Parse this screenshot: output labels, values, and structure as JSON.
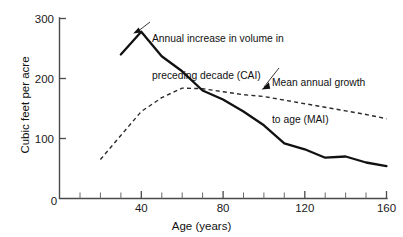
{
  "chart_data": {
    "type": "line",
    "title": "",
    "xlabel": "Age (years)",
    "ylabel": "Cubic feet per acre",
    "xlim": [
      0,
      160
    ],
    "ylim": [
      0,
      300
    ],
    "grid": false,
    "legend_position": "annotations-on-plot",
    "x_ticks": [
      0,
      40,
      80,
      120,
      160
    ],
    "x_tick_labels": [
      "0",
      "40",
      "80",
      "120",
      "160"
    ],
    "x_minor_tick_step": 10,
    "y_ticks": [
      0,
      100,
      200,
      300
    ],
    "y_tick_labels": [
      "0",
      "100",
      "200",
      "300"
    ],
    "series": [
      {
        "name": "Annual increase in volume in preceding decade (CAI)",
        "short_name": "CAI",
        "style": "solid",
        "color": "#111111",
        "x": [
          30,
          40,
          50,
          60,
          70,
          80,
          90,
          100,
          110,
          120,
          130,
          140,
          150,
          160
        ],
        "values": [
          240,
          278,
          237,
          212,
          180,
          165,
          145,
          122,
          92,
          82,
          68,
          70,
          60,
          54
        ]
      },
      {
        "name": "Mean annual growth to age (MAI)",
        "short_name": "MAI",
        "style": "dashed",
        "color": "#2b2b2b",
        "x": [
          20,
          30,
          40,
          50,
          60,
          70,
          80,
          90,
          100,
          110,
          120,
          130,
          140,
          150,
          160
        ],
        "values": [
          65,
          105,
          145,
          168,
          184,
          183,
          178,
          173,
          170,
          164,
          158,
          152,
          146,
          140,
          133
        ]
      }
    ],
    "annotations": [
      {
        "id": "cai",
        "lines": [
          "Annual increase in volume in",
          "preceding decade (CAI)"
        ],
        "points_to": {
          "x": 45,
          "y": 252
        }
      },
      {
        "id": "mai",
        "lines": [
          "Mean annual growth",
          "to age (MAI)"
        ],
        "points_to": {
          "x": 103,
          "y": 170
        }
      }
    ]
  }
}
